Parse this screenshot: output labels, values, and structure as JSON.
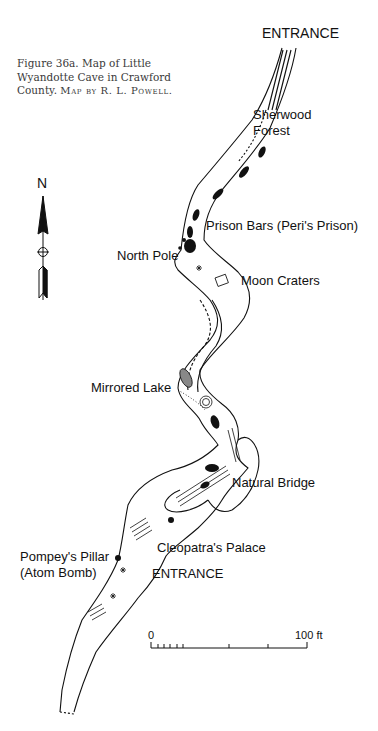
{
  "figure": {
    "caption": "Figure 36a.  Map of Little Wyandotte Cave in Crawford County.",
    "caption_line1": "Figure 36a.  Map of Little",
    "caption_line2": "Wyandotte Cave in Crawford",
    "caption_line3_prefix": "County.  ",
    "credit": "Map by R. L. Powell."
  },
  "compass": {
    "label": "N",
    "icon": "north-arrow-icon"
  },
  "labels": {
    "entrance_top": "ENTRANCE",
    "sherwood_1": "Sherwood",
    "sherwood_2": "Forest",
    "prison_bars": "Prison Bars (Peri's Prison)",
    "north_pole": "North Pole",
    "moon_craters": "Moon Craters",
    "mirrored_lake": "Mirrored Lake",
    "natural_bridge": "Natural Bridge",
    "cleopatra": "Cleopatra's Palace",
    "pompey_1": "Pompey's Pillar",
    "pompey_2": "(Atom Bomb)",
    "entrance_bottom": "ENTRANCE"
  },
  "scale_bar": {
    "start_label": "0",
    "end_label": "100 ft",
    "units": "ft",
    "length": 100
  }
}
